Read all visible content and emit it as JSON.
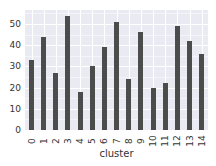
{
  "chart_data": {
    "type": "bar",
    "title": "",
    "xlabel": "cluster",
    "ylabel": "",
    "categories": [
      "0",
      "1",
      "2",
      "3",
      "4",
      "5",
      "6",
      "7",
      "8",
      "9",
      "10",
      "11",
      "12",
      "13",
      "14"
    ],
    "values": [
      33,
      44,
      27,
      54,
      18,
      30,
      39,
      51,
      24,
      46,
      20,
      22,
      49,
      42,
      36
    ],
    "ylim": [
      0,
      57
    ],
    "yticks": [
      0,
      10,
      20,
      30,
      40,
      50
    ],
    "grid": true,
    "legend": null,
    "bar_color": "#4c4c4c",
    "background_color": "#eaeaf2"
  }
}
